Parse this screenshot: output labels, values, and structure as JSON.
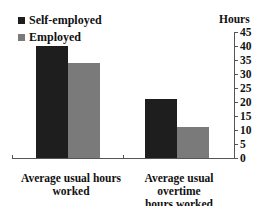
{
  "chart_data": {
    "type": "bar",
    "title": "",
    "xlabel": "",
    "ylabel": "Hours",
    "ylim": [
      0,
      45
    ],
    "yticks": [
      0,
      5,
      10,
      15,
      20,
      25,
      30,
      35,
      40,
      45
    ],
    "categories": [
      "Average usual hours worked",
      "Average usual overtime hours worked"
    ],
    "category_lines": [
      [
        "Average usual hours",
        "worked"
      ],
      [
        "Average usual overtime",
        "hours worked"
      ]
    ],
    "series": [
      {
        "name": "Self-employed",
        "color": "#1e1e1e",
        "values": [
          40,
          21
        ]
      },
      {
        "name": "Employed",
        "color": "#7a7a7a",
        "values": [
          34,
          11
        ]
      }
    ],
    "legend_position": "top-left",
    "grid": false,
    "y_axis_side": "right"
  }
}
